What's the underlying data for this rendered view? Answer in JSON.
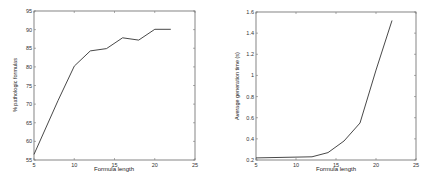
{
  "chart_data": [
    {
      "type": "line",
      "title": "",
      "xlabel": "Formula length",
      "ylabel": "% pathologic formulas",
      "xlim": [
        5,
        25
      ],
      "ylim": [
        55,
        95
      ],
      "xticks": [
        5,
        10,
        15,
        20,
        25
      ],
      "yticks": [
        55,
        60,
        65,
        70,
        75,
        80,
        85,
        90,
        95
      ],
      "grid": false,
      "x": [
        5,
        8,
        10,
        12,
        14,
        16,
        18,
        20,
        22
      ],
      "values": [
        56.5,
        71,
        80.2,
        84.3,
        84.9,
        87.8,
        87.2,
        90.1,
        90.1
      ]
    },
    {
      "type": "line",
      "title": "",
      "xlabel": "Formula length",
      "ylabel": "Average generation time (s)",
      "xlim": [
        5,
        25
      ],
      "ylim": [
        0.2,
        1.6
      ],
      "xticks": [
        5,
        10,
        15,
        20,
        25
      ],
      "yticks": [
        0.2,
        0.4,
        0.6,
        0.8,
        1,
        1.2,
        1.4,
        1.6
      ],
      "grid": false,
      "x": [
        5,
        12,
        14,
        16,
        18,
        20,
        22
      ],
      "values": [
        0.22,
        0.23,
        0.27,
        0.38,
        0.55,
        1.05,
        1.52
      ]
    }
  ],
  "left": {
    "xlabel": "Formula length",
    "ylabel": "% pathologic formulas",
    "xtick_labels": [
      "5",
      "10",
      "15",
      "20",
      "25"
    ],
    "ytick_labels": [
      "55",
      "60",
      "65",
      "70",
      "75",
      "80",
      "85",
      "90",
      "95"
    ]
  },
  "right": {
    "xlabel": "Formula length",
    "ylabel": "Average generation time (s)",
    "xtick_labels": [
      "5",
      "10",
      "15",
      "20",
      "25"
    ],
    "ytick_labels": [
      "0.2",
      "0.4",
      "0.6",
      "0.8",
      "1",
      "1.2",
      "1.4",
      "1.6"
    ]
  },
  "colors": {
    "line": "#333333",
    "axes": "#555555"
  }
}
